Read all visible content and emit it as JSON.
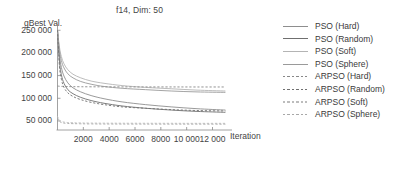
{
  "chart_data": {
    "type": "line",
    "title": "f14, Dim: 50",
    "xlabel": "Iteration",
    "ylabel": "gBest Val.",
    "xlim": [
      0,
      13200
    ],
    "ylim": [
      30000,
      255000
    ],
    "grid": false,
    "legend_position": "right",
    "xticks": [
      "2000",
      "4000",
      "6000",
      "8000",
      "10 000",
      "12 000"
    ],
    "xtick_values": [
      2000,
      4000,
      6000,
      8000,
      10000,
      12000
    ],
    "yticks": [
      "250 000",
      "200 000",
      "150 000",
      "100 000",
      "50 000"
    ],
    "ytick_values": [
      250000,
      200000,
      150000,
      100000,
      50000
    ],
    "x": [
      0,
      150,
      300,
      500,
      800,
      1200,
      1800,
      2600,
      3600,
      5000,
      6800,
      8800,
      10800,
      13000
    ],
    "series": [
      {
        "name": "PSO (Hard)",
        "style": "solid",
        "color": "#8e8e8e",
        "values": [
          250000,
          196000,
          168000,
          149000,
          134000,
          123000,
          114000,
          106000,
          99000,
          92000,
          86000,
          81000,
          77000,
          74000
        ]
      },
      {
        "name": "PSO (Random)",
        "style": "solid",
        "color": "#6f6f6f",
        "values": [
          250000,
          182000,
          152000,
          133000,
          119000,
          110000,
          102000,
          95000,
          89000,
          83000,
          78000,
          74000,
          71000,
          69000
        ]
      },
      {
        "name": "PSO (Soft)",
        "style": "solid",
        "color": "#b4b4b4",
        "values": [
          250000,
          213000,
          192000,
          176000,
          163000,
          153000,
          145000,
          138000,
          133000,
          128000,
          124000,
          121000,
          118000,
          116000
        ]
      },
      {
        "name": "PSO (Sphere)",
        "style": "solid",
        "color": "#9a9a9a",
        "values": [
          250000,
          206000,
          183000,
          167000,
          154000,
          145000,
          137000,
          131000,
          126000,
          122000,
          119000,
          116000,
          114000,
          113000
        ]
      },
      {
        "name": "ARPSO (Hard)",
        "style": "dashed",
        "color": "#888888",
        "values": [
          127000,
          126500,
          126200,
          126000,
          125800,
          125600,
          125400,
          125300,
          125200,
          125100,
          125000,
          125000,
          124900,
          124900
        ]
      },
      {
        "name": "ARPSO (Random)",
        "style": "dashed",
        "color": "#707070",
        "values": [
          250000,
          171000,
          142000,
          124000,
          112000,
          104000,
          97000,
          91000,
          86000,
          81000,
          78000,
          75000,
          73000,
          72000
        ]
      },
      {
        "name": "ARPSO (Soft)",
        "style": "dashed",
        "color": "#bdbdbd",
        "values": [
          60000,
          52000,
          49000,
          47500,
          46500,
          46000,
          45600,
          45300,
          45100,
          45000,
          44900,
          44800,
          44700,
          44700
        ]
      },
      {
        "name": "ARPSO (Sphere)",
        "style": "dashed",
        "color": "#a8a8a8",
        "values": [
          56000,
          49000,
          46500,
          45200,
          44400,
          44000,
          43700,
          43400,
          43200,
          43100,
          43000,
          42900,
          42900,
          42800
        ]
      }
    ]
  },
  "axis": {
    "color": "#8a8a8a"
  }
}
